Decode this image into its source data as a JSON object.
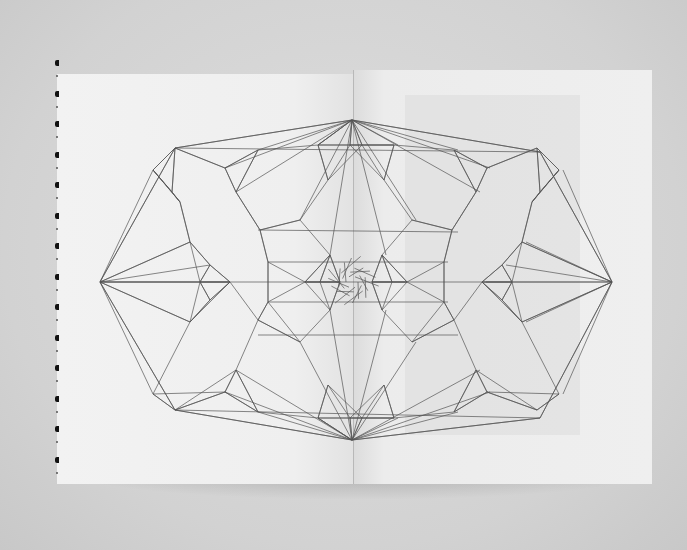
{
  "scene": {
    "subject": "open book spread with geometric line drawing",
    "background_color": "#d6d6d6",
    "page_color": "#efefef",
    "line_color": "#555555"
  },
  "drawing": {
    "description": "symmetric polygonal lattice of straight lines spanning both pages, converging to a dense knot at center",
    "hull": [
      [
        100,
        282
      ],
      [
        175,
        148
      ],
      [
        352,
        120
      ],
      [
        540,
        152
      ],
      [
        612,
        282
      ],
      [
        540,
        418
      ],
      [
        352,
        440
      ],
      [
        175,
        410
      ]
    ]
  }
}
